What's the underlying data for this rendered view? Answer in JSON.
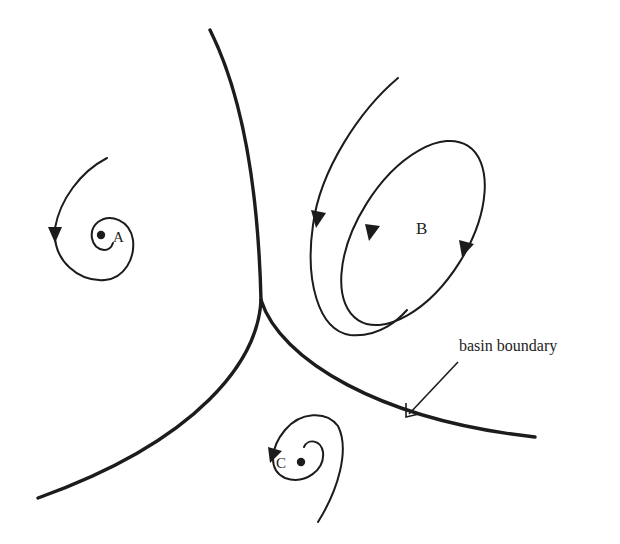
{
  "figure": {
    "type": "phase-portrait",
    "attractors": [
      {
        "id": "A",
        "label": "A",
        "kind": "spiral fixed point"
      },
      {
        "id": "B",
        "label": "B",
        "kind": "limit cycle"
      },
      {
        "id": "C",
        "label": "C",
        "kind": "spiral fixed point"
      }
    ],
    "annotation": {
      "text": "basin boundary"
    },
    "colors": {
      "background": "#ffffff",
      "ink": "#1c1c1c"
    }
  }
}
